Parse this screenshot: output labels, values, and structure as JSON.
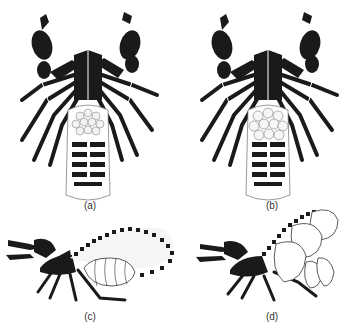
{
  "figure": {
    "panels": [
      {
        "id": "a",
        "label": "(a)",
        "view": "dorsal",
        "subject": "scorpion with egg mass"
      },
      {
        "id": "b",
        "label": "(b)",
        "view": "dorsal",
        "subject": "scorpion with larger egg mass"
      },
      {
        "id": "c",
        "label": "(c)",
        "view": "lateral",
        "subject": "scorpion with expanded dotted abdomen"
      },
      {
        "id": "d",
        "label": "(d)",
        "view": "lateral",
        "subject": "scorpion with segmented swollen abdomen"
      }
    ],
    "colors": {
      "ink": "#1a1a1a",
      "paper": "#ffffff",
      "egg": "#f2f2f2"
    }
  }
}
